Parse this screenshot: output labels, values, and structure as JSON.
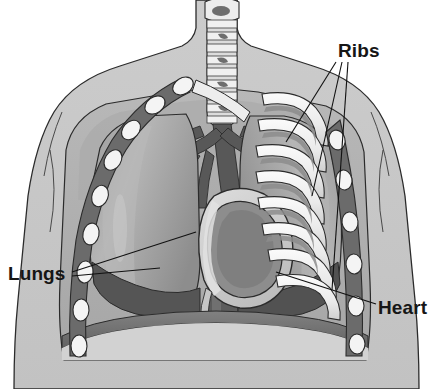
{
  "figure": {
    "background_color": "#ffffff",
    "width": 433,
    "height": 389
  },
  "labels": [
    {
      "id": "ribs",
      "text": "Ribs",
      "x": 338,
      "y": 57,
      "anchor": "start",
      "leader_count": 3
    },
    {
      "id": "lungs",
      "text": "Lungs",
      "x": 8,
      "y": 280,
      "anchor": "start",
      "leader_count": 2
    },
    {
      "id": "heart",
      "text": "Heart",
      "x": 378,
      "y": 314,
      "anchor": "start",
      "leader_count": 1
    }
  ],
  "structures": {
    "body": {
      "name": "torso-silhouette",
      "fill": "#c9c9c9",
      "outline": "#2b2b2b"
    },
    "chest_cavity": {
      "name": "thoracic-cavity",
      "fill": "#b4b4b4"
    },
    "trachea": {
      "name": "trachea",
      "fill": "#e8e8e8",
      "ring_shadow": "#7d7d7d",
      "segments": 9
    },
    "lung_left": {
      "name": "left-lung",
      "fill": "#a0a0a0",
      "highlight": "#c2c2c2"
    },
    "lung_right": {
      "name": "right-lung",
      "fill": "#9a9a9a",
      "highlight": "#bdbdbd"
    },
    "heart": {
      "name": "heart",
      "outer_fill": "#cfcfcf",
      "inner_fill": "#8e8e8e",
      "outline": "#2b2b2b"
    },
    "diaphragm": {
      "name": "diaphragm",
      "fill": "#6f6f6f"
    },
    "vessels": {
      "name": "great-vessels",
      "fill": "#5e5e5e"
    },
    "ribs_cut": {
      "name": "rib-cross-sections",
      "fill": "#f2f2f2",
      "band": "#6b6b6b",
      "count_left": 9,
      "count_right": 9
    },
    "ribs_arc": {
      "name": "rib-arcs",
      "fill": "#f4f4f4",
      "shadow": "#8a8a8a",
      "count": 8
    }
  },
  "colors": {
    "ink": "#2b2b2b",
    "skin": "#c9c9c9",
    "cavity": "#b4b4b4",
    "bone": "#f2f2f2",
    "muscle": "#7a7a7a",
    "deep": "#5e5e5e"
  }
}
